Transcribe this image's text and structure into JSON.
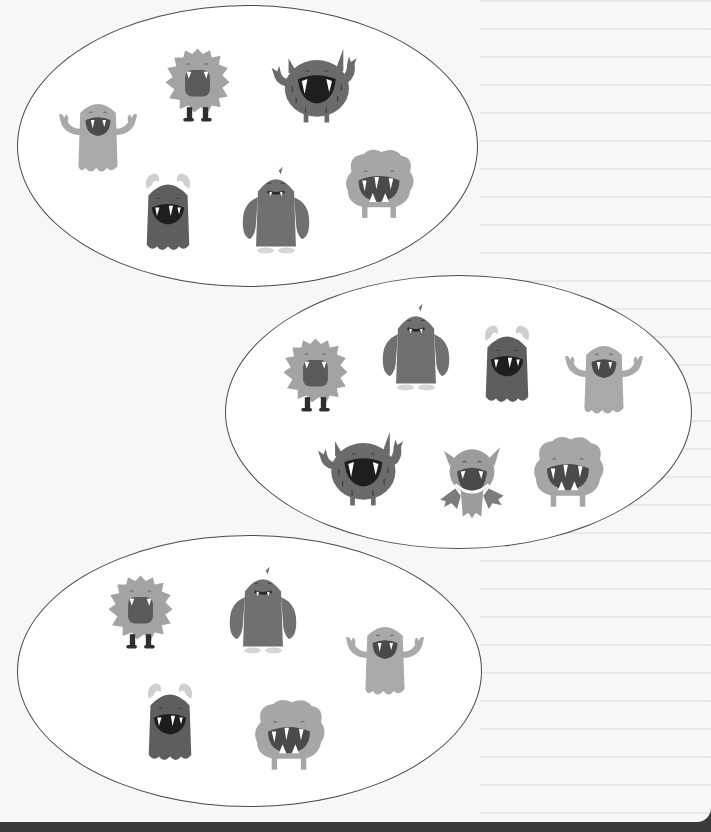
{
  "worksheet": {
    "description": "Three groups of monsters enclosed in ellipses",
    "colors": {
      "paper": "#f7f7f7",
      "outline": "#4a4a4a",
      "dark_band": "#3b3b3b",
      "monster_light": "#a9a9a9",
      "monster_mid": "#8f8f8f",
      "monster_dark": "#6b6b6b",
      "mouth": "#2a2a2a"
    },
    "groups": [
      {
        "name": "group-1",
        "count": 6,
        "monsters": [
          "ghost-light",
          "furry",
          "horned-dark",
          "horned-blob",
          "yeti",
          "cloud"
        ]
      },
      {
        "name": "group-2",
        "count": 7,
        "monsters": [
          "furry",
          "yeti",
          "horned-blob",
          "ghost-light",
          "horned-dark",
          "bat",
          "cloud"
        ]
      },
      {
        "name": "group-3",
        "count": 5,
        "monsters": [
          "furry",
          "yeti",
          "ghost-light",
          "horned-blob",
          "cloud"
        ]
      }
    ]
  }
}
